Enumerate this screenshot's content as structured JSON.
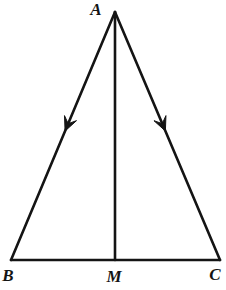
{
  "figure": {
    "width": 226,
    "height": 290,
    "background_color": "#ffffff",
    "stroke_color": "#141414",
    "stroke_width": 2.6,
    "label_font_size": 17,
    "points": {
      "A": {
        "x": 115,
        "y": 12
      },
      "B": {
        "x": 11,
        "y": 260
      },
      "C": {
        "x": 220,
        "y": 260
      },
      "M": {
        "x": 115,
        "y": 260
      }
    },
    "segments": [
      {
        "from": "A",
        "to": "B",
        "name": "side-AB"
      },
      {
        "from": "A",
        "to": "C",
        "name": "side-AC"
      },
      {
        "from": "B",
        "to": "C",
        "name": "side-BC"
      },
      {
        "from": "A",
        "to": "M",
        "name": "median-AM"
      }
    ],
    "arrows": [
      {
        "from": "A",
        "to": "B",
        "t": 0.48,
        "name": "arrowhead-on-AB"
      },
      {
        "from": "A",
        "to": "C",
        "t": 0.48,
        "name": "arrowhead-on-AC"
      }
    ],
    "arrow_shape": {
      "length": 14,
      "half_width": 6.5,
      "notch": 8
    },
    "labels": [
      {
        "text": "A",
        "x": 96,
        "y": 15,
        "name": "vertex-label-A"
      },
      {
        "text": "B",
        "x": 8,
        "y": 281,
        "name": "vertex-label-B"
      },
      {
        "text": "M",
        "x": 114,
        "y": 282,
        "name": "vertex-label-M"
      },
      {
        "text": "C",
        "x": 215,
        "y": 280,
        "name": "vertex-label-C"
      }
    ]
  }
}
